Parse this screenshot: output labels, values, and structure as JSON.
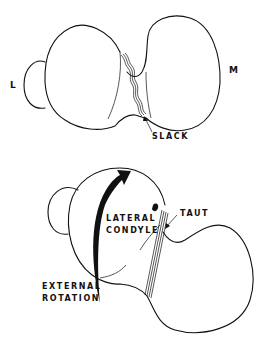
{
  "figure_top": {
    "side_left_label": "L",
    "side_right_label": "M",
    "ligament_state_label": "SLACK"
  },
  "figure_bottom": {
    "condyle_label_line1": "LATERAL",
    "condyle_label_line2": "CONDYLE",
    "ligament_state_label": "TAUT",
    "motion_label_line1": "EXTERNAL",
    "motion_label_line2": "ROTATION"
  },
  "colors": {
    "line": "#111111",
    "background": "#ffffff"
  }
}
